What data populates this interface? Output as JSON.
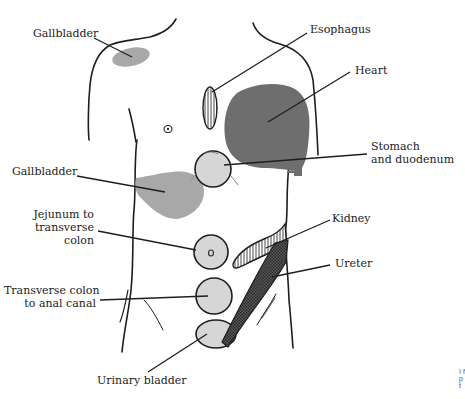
{
  "figure": {
    "type": "referred pain map, anterior torso",
    "colors": {
      "outline": "#1e1e1e",
      "light_fill": "#d6d6d6",
      "medium_fill": "#a8a8a8",
      "dark_fill": "#6e6e6e",
      "leader": "#1e1e1e"
    },
    "labels": {
      "gallbladder_shoulder": "Gallbladder",
      "esophagus": "Esophagus",
      "heart": "Heart",
      "stomach": "Stomach\nand duodenum",
      "gallbladder_abdomen": "Gallbladder",
      "jejunum": "Jejunum to\ntransverse\ncolon",
      "kidney": "Kidney",
      "ureter": "Ureter",
      "transverse_colon": "Transverse colon\nto anal canal",
      "urinary_bladder": "Urinary bladder"
    },
    "regions": [
      {
        "name": "Gallbladder (shoulder)",
        "pattern": "medium solid"
      },
      {
        "name": "Esophagus",
        "pattern": "vertical hatch"
      },
      {
        "name": "Heart",
        "pattern": "dark solid"
      },
      {
        "name": "Stomach and duodenum",
        "pattern": "light circle"
      },
      {
        "name": "Gallbladder (abdomen)",
        "pattern": "medium solid"
      },
      {
        "name": "Jejunum to transverse colon",
        "pattern": "light circle"
      },
      {
        "name": "Kidney",
        "pattern": "vertical hatch"
      },
      {
        "name": "Ureter",
        "pattern": "cross-hatch dark band"
      },
      {
        "name": "Transverse colon to anal canal",
        "pattern": "light circle"
      },
      {
        "name": "Urinary bladder",
        "pattern": "light ellipse"
      }
    ],
    "caption_fragment": "I\nf\np\nt"
  }
}
